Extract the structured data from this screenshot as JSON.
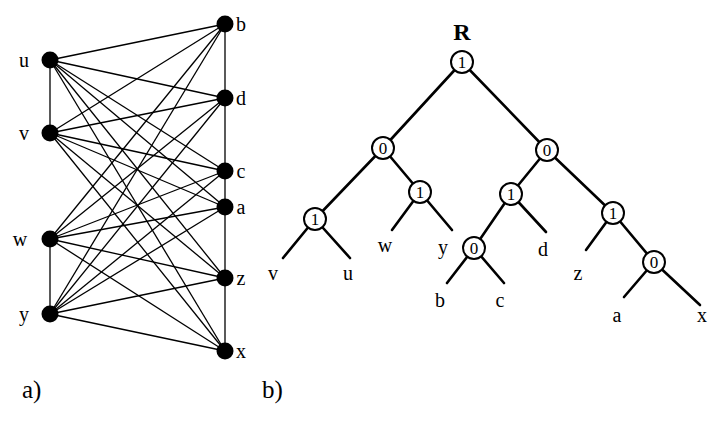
{
  "figure": {
    "background_color": "#ffffff",
    "ink_color": "#000000",
    "panels": [
      {
        "id": "panel-a",
        "caption": "a)",
        "caption_x": 22,
        "caption_y": 398,
        "type": "bipartite-graph"
      },
      {
        "id": "panel-b",
        "caption": "b)",
        "caption_x": 262,
        "caption_y": 398,
        "type": "binary-tree"
      }
    ]
  },
  "graph": {
    "left_column_x": 50,
    "right_column_x": 225,
    "vertex_radius": 8.5,
    "edge_width": 1.3,
    "left_vertices": [
      {
        "id": "u",
        "label": "u",
        "x": 50,
        "y": 60,
        "label_x": 24,
        "label_y": 67
      },
      {
        "id": "v",
        "label": "v",
        "x": 50,
        "y": 133,
        "label_x": 24,
        "label_y": 140
      },
      {
        "id": "w",
        "label": "w",
        "x": 50,
        "y": 239,
        "label_x": 20,
        "label_y": 246
      },
      {
        "id": "y",
        "label": "y",
        "x": 50,
        "y": 314,
        "label_x": 24,
        "label_y": 321
      }
    ],
    "right_vertices": [
      {
        "id": "b",
        "label": "b",
        "x": 225,
        "y": 24,
        "label_x": 241,
        "label_y": 31
      },
      {
        "id": "d",
        "label": "d",
        "x": 225,
        "y": 98,
        "label_x": 241,
        "label_y": 105
      },
      {
        "id": "c",
        "label": "c",
        "x": 225,
        "y": 171,
        "label_x": 241,
        "label_y": 178
      },
      {
        "id": "a",
        "label": "a",
        "x": 225,
        "y": 207,
        "label_x": 241,
        "label_y": 214
      },
      {
        "id": "z",
        "label": "z",
        "x": 225,
        "y": 278,
        "label_x": 241,
        "label_y": 285
      },
      {
        "id": "x",
        "label": "x",
        "x": 225,
        "y": 351,
        "label_x": 241,
        "label_y": 358
      }
    ],
    "vertical_edges": [
      {
        "from": "u",
        "to": "v"
      },
      {
        "from": "w",
        "to": "y"
      },
      {
        "from": "b",
        "to": "d"
      },
      {
        "from": "d",
        "to": "c"
      },
      {
        "from": "c",
        "to": "a"
      },
      {
        "from": "a",
        "to": "z"
      },
      {
        "from": "z",
        "to": "x"
      }
    ],
    "cross_edges": [
      {
        "from": "u",
        "to": "b"
      },
      {
        "from": "u",
        "to": "d"
      },
      {
        "from": "u",
        "to": "c"
      },
      {
        "from": "u",
        "to": "a"
      },
      {
        "from": "u",
        "to": "z"
      },
      {
        "from": "u",
        "to": "x"
      },
      {
        "from": "v",
        "to": "b"
      },
      {
        "from": "v",
        "to": "d"
      },
      {
        "from": "v",
        "to": "c"
      },
      {
        "from": "v",
        "to": "a"
      },
      {
        "from": "v",
        "to": "z"
      },
      {
        "from": "v",
        "to": "x"
      },
      {
        "from": "w",
        "to": "b"
      },
      {
        "from": "w",
        "to": "d"
      },
      {
        "from": "w",
        "to": "c"
      },
      {
        "from": "w",
        "to": "a"
      },
      {
        "from": "w",
        "to": "z"
      },
      {
        "from": "w",
        "to": "x"
      },
      {
        "from": "y",
        "to": "b"
      },
      {
        "from": "y",
        "to": "d"
      },
      {
        "from": "y",
        "to": "c"
      },
      {
        "from": "y",
        "to": "a"
      },
      {
        "from": "y",
        "to": "z"
      },
      {
        "from": "y",
        "to": "x"
      }
    ]
  },
  "tree": {
    "root_annotation": "R",
    "root_annotation_x": 462,
    "root_annotation_y": 40,
    "node_radius": 11,
    "edge_width": 2.6,
    "nodes": [
      {
        "id": "n-root",
        "label": "1",
        "x": 462,
        "y": 62
      },
      {
        "id": "n-l",
        "label": "0",
        "x": 383,
        "y": 148
      },
      {
        "id": "n-r",
        "label": "0",
        "x": 547,
        "y": 150
      },
      {
        "id": "n-ll",
        "label": "1",
        "x": 315,
        "y": 219
      },
      {
        "id": "n-lr",
        "label": "1",
        "x": 420,
        "y": 192
      },
      {
        "id": "n-rl",
        "label": "1",
        "x": 511,
        "y": 194
      },
      {
        "id": "n-rr",
        "label": "1",
        "x": 613,
        "y": 213
      },
      {
        "id": "n-rll",
        "label": "0",
        "x": 474,
        "y": 248
      },
      {
        "id": "n-rrr",
        "label": "0",
        "x": 654,
        "y": 262
      }
    ],
    "internal_edges": [
      {
        "from": "n-root",
        "to": "n-l"
      },
      {
        "from": "n-root",
        "to": "n-r"
      },
      {
        "from": "n-l",
        "to": "n-ll"
      },
      {
        "from": "n-l",
        "to": "n-lr"
      },
      {
        "from": "n-r",
        "to": "n-rl"
      },
      {
        "from": "n-r",
        "to": "n-rr"
      },
      {
        "from": "n-rl",
        "to": "n-rll"
      },
      {
        "from": "n-rr",
        "to": "n-rrr"
      }
    ],
    "leaves": [
      {
        "id": "leaf-v",
        "label": "v",
        "parent": "n-ll",
        "tip_x": 283,
        "tip_y": 258,
        "label_x": 273,
        "label_y": 280
      },
      {
        "id": "leaf-u",
        "label": "u",
        "parent": "n-ll",
        "tip_x": 350,
        "tip_y": 258,
        "label_x": 348,
        "label_y": 280
      },
      {
        "id": "leaf-w",
        "label": "w",
        "parent": "n-lr",
        "tip_x": 392,
        "tip_y": 230,
        "label_x": 385,
        "label_y": 252
      },
      {
        "id": "leaf-y",
        "label": "y",
        "parent": "n-lr",
        "tip_x": 452,
        "tip_y": 230,
        "label_x": 443,
        "label_y": 254
      },
      {
        "id": "leaf-b",
        "label": "b",
        "parent": "n-rll",
        "tip_x": 447,
        "tip_y": 283,
        "label_x": 440,
        "label_y": 307
      },
      {
        "id": "leaf-c",
        "label": "c",
        "parent": "n-rll",
        "tip_x": 504,
        "tip_y": 283,
        "label_x": 500,
        "label_y": 307
      },
      {
        "id": "leaf-d",
        "label": "d",
        "parent": "n-rl",
        "tip_x": 546,
        "tip_y": 232,
        "label_x": 543,
        "label_y": 256
      },
      {
        "id": "leaf-z",
        "label": "z",
        "parent": "n-rr",
        "tip_x": 586,
        "tip_y": 250,
        "label_x": 578,
        "label_y": 280
      },
      {
        "id": "leaf-a",
        "label": "a",
        "parent": "n-rrr",
        "tip_x": 624,
        "tip_y": 297,
        "label_x": 617,
        "label_y": 322
      },
      {
        "id": "leaf-x",
        "label": "x",
        "parent": "n-rrr",
        "tip_x": 700,
        "tip_y": 305,
        "label_x": 702,
        "label_y": 322
      }
    ]
  }
}
